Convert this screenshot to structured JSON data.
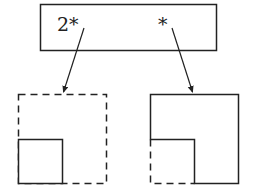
{
  "diagram": {
    "top_box": {
      "labels": [
        {
          "text": "2*",
          "role": "left-pointer-label"
        },
        {
          "text": "*",
          "role": "right-pointer-label"
        }
      ]
    },
    "left_figure": {
      "outer": "dashed-square",
      "inner": "solid-square-bottom-left"
    },
    "right_figure": {
      "outer": "solid-L-shape",
      "missing_corner": "dashed-square-bottom-left"
    },
    "arrows": [
      {
        "from": "2*",
        "to": "left_figure"
      },
      {
        "from": "*",
        "to": "right_figure"
      }
    ],
    "colors": {
      "stroke": "#222222",
      "background": "#ffffff"
    }
  }
}
